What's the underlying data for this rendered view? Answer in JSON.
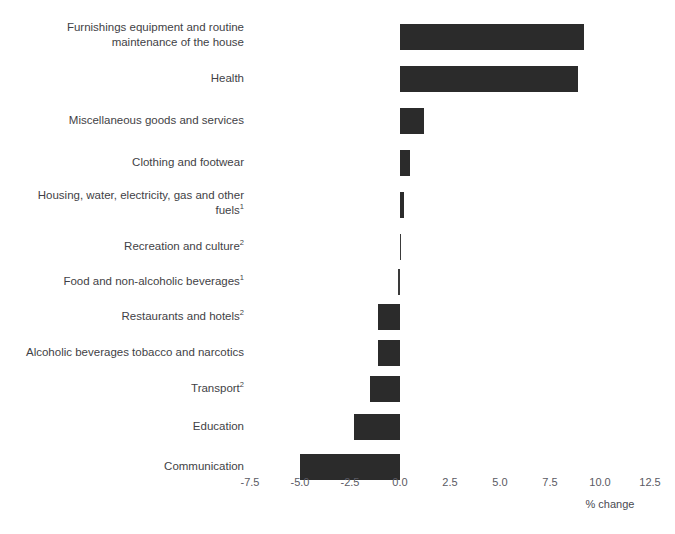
{
  "chart_data": {
    "type": "bar",
    "orientation": "horizontal",
    "title": "",
    "xlabel": "% change",
    "ylabel": "",
    "xlim": [
      -8.6,
      13.7
    ],
    "xticks": [
      "-7.5",
      "-5.0",
      "-2.5",
      "0.0",
      "2.5",
      "5.0",
      "7.5",
      "10.0",
      "12.5"
    ],
    "xtick_values": [
      -7.5,
      -5.0,
      -2.5,
      0.0,
      2.5,
      5.0,
      7.5,
      10.0,
      12.5
    ],
    "grid": false,
    "legend": null,
    "bar_color": "#2b2b2b",
    "categories": [
      "Furnishings equipment and routine maintenance of the house",
      "Health",
      "Miscellaneous goods and services",
      "Clothing and footwear",
      "Housing, water, electricity, gas and other fuels",
      "Recreation and culture",
      "Food and non-alcoholic beverages",
      "Restaurants and hotels",
      "Alcoholic beverages tobacco and narcotics",
      "Transport",
      "Education",
      "Communication"
    ],
    "category_footnotes": [
      "",
      "",
      "",
      "",
      "1",
      "2",
      "1",
      "2",
      "",
      "2",
      "",
      ""
    ],
    "values": [
      9.2,
      8.9,
      1.2,
      0.5,
      0.2,
      0.03,
      -0.12,
      -1.1,
      -1.1,
      -1.5,
      -2.3,
      -5.0
    ]
  },
  "axis": {
    "x_title": "% change"
  },
  "labels": {
    "rows": [
      {
        "line1": "Furnishings equipment and routine",
        "line2": "maintenance of the house",
        "sup": ""
      },
      {
        "line1": "Health",
        "line2": "",
        "sup": ""
      },
      {
        "line1": "Miscellaneous goods and services",
        "line2": "",
        "sup": ""
      },
      {
        "line1": "Clothing and footwear",
        "line2": "",
        "sup": ""
      },
      {
        "line1": "Housing, water, electricity, gas and other",
        "line2": "fuels",
        "sup": "1"
      },
      {
        "line1": "Recreation and culture",
        "line2": "",
        "sup": "2"
      },
      {
        "line1": "Food and non-alcoholic beverages",
        "line2": "",
        "sup": "1"
      },
      {
        "line1": "Restaurants and hotels",
        "line2": "",
        "sup": "2"
      },
      {
        "line1": "Alcoholic beverages tobacco and narcotics",
        "line2": "",
        "sup": ""
      },
      {
        "line1": "Transport",
        "line2": "",
        "sup": "2"
      },
      {
        "line1": "Education",
        "line2": "",
        "sup": ""
      },
      {
        "line1": "Communication",
        "line2": "",
        "sup": ""
      }
    ]
  }
}
